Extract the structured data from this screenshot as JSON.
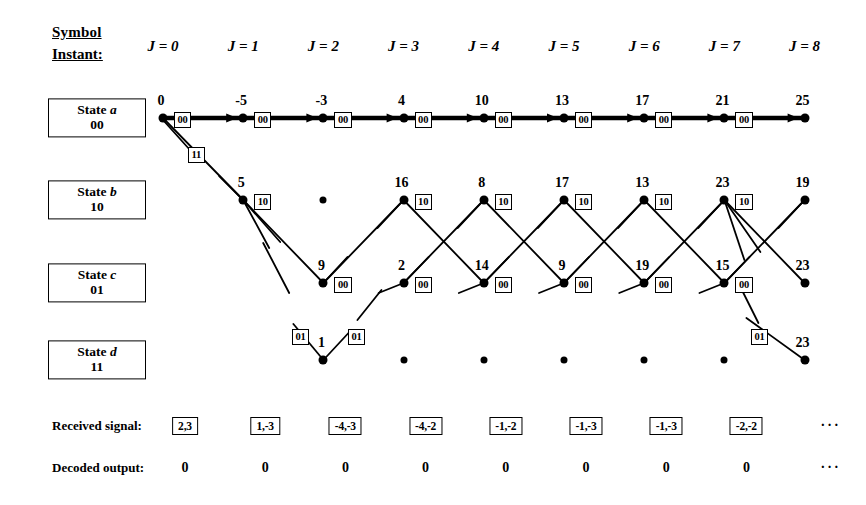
{
  "header": {
    "symbol_label": "Symbol",
    "instant_label": "Instant:",
    "instants": [
      "J = 0",
      "J = 1",
      "J = 2",
      "J = 3",
      "J = 4",
      "J = 5",
      "J = 6",
      "J = 7",
      "J = 8"
    ]
  },
  "states": [
    {
      "name": "State a",
      "letter": "a",
      "bits": "00"
    },
    {
      "name": "State b",
      "letter": "b",
      "bits": "10"
    },
    {
      "name": "State c",
      "letter": "c",
      "bits": "01"
    },
    {
      "name": "State d",
      "letter": "d",
      "bits": "11"
    }
  ],
  "chart_data": {
    "type": "diagram",
    "instants": [
      0,
      1,
      2,
      3,
      4,
      5,
      6,
      7,
      8
    ],
    "path_metrics": {
      "state_a": [
        0,
        -5,
        -3,
        4,
        10,
        13,
        17,
        21,
        25
      ],
      "state_b": [
        null,
        5,
        null,
        16,
        8,
        17,
        13,
        23,
        19
      ],
      "state_c": [
        null,
        null,
        9,
        2,
        14,
        9,
        19,
        15,
        23
      ],
      "state_d": [
        null,
        null,
        1,
        null,
        null,
        null,
        null,
        null,
        23
      ]
    },
    "branch_codes": {
      "state_a": [
        "00",
        "00",
        "00",
        "00",
        "00",
        "00",
        "00",
        "00",
        ""
      ],
      "state_b": [
        "",
        "10",
        "",
        "10",
        "10",
        "10",
        "10",
        "10",
        ""
      ],
      "state_c": [
        "",
        "",
        "00",
        "00",
        "00",
        "00",
        "00",
        "00",
        ""
      ],
      "state_d": [
        "",
        "",
        "",
        "",
        "",
        "",
        "",
        "",
        ""
      ]
    },
    "extra_codes": [
      {
        "label": "11",
        "x": 188,
        "y": 155
      },
      {
        "label": "01",
        "x": 292,
        "y": 337
      },
      {
        "label": "01",
        "x": 348,
        "y": 337
      },
      {
        "label": "01",
        "x": 751,
        "y": 337
      }
    ],
    "received_signal": [
      "2,3",
      "1,-3",
      "-4,-3",
      "-4,-2",
      "-1,-2",
      "-1,-3",
      "-1,-3",
      "-2,-2"
    ],
    "decoded_output": [
      "0",
      "0",
      "0",
      "0",
      "0",
      "0",
      "0",
      "0"
    ],
    "continuation": "···"
  },
  "bottom": {
    "received_label": "Received signal:",
    "decoded_label": "Decoded output:"
  },
  "colors": {
    "ink": "#000000",
    "paper": "#ffffff"
  }
}
